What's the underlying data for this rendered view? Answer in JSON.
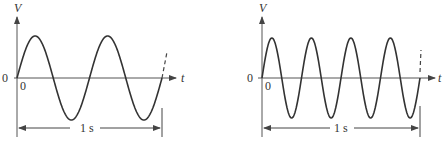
{
  "diagrams": [
    {
      "id": "left",
      "y_axis_label": "V",
      "x_axis_label": "t",
      "origin_left_label": "0",
      "origin_below_label": "0",
      "duration_label": "1 s",
      "cycles": 2,
      "description": "Sine wave, 2 cycles in 1 s"
    },
    {
      "id": "right",
      "y_axis_label": "V",
      "x_axis_label": "t",
      "origin_left_label": "0",
      "origin_below_label": "0",
      "duration_label": "1 s",
      "cycles": 4,
      "description": "Sine wave, 4 cycles in 1 s"
    }
  ],
  "colors": {
    "stroke": "#333333",
    "axis": "#555555",
    "background": "#ffffff"
  }
}
